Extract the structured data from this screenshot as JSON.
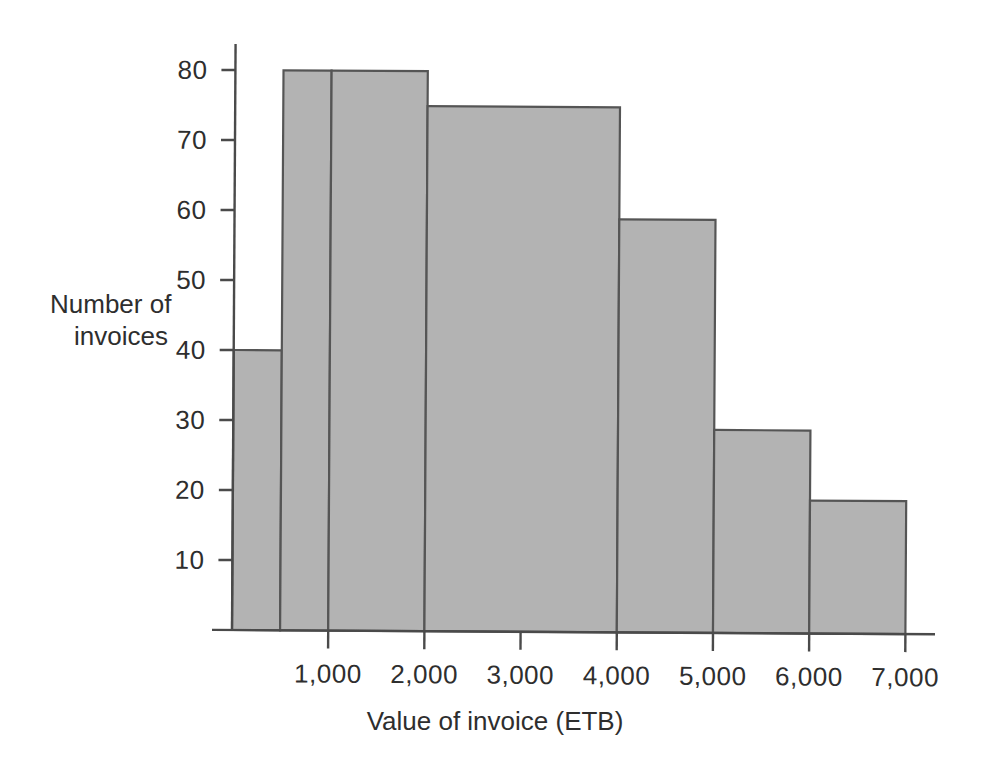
{
  "figure": {
    "background_color": "#ffffff",
    "bar_fill_color": "#b3b3b3",
    "bar_border_color": "#555555",
    "axis_color": "#4a4a4a",
    "text_color": "#2e2e2e"
  },
  "axes": {
    "y_title_line1": "Number of",
    "y_title_line2": "invoices",
    "x_title": "Value of invoice (ETB)",
    "y_ticks": [
      "10",
      "20",
      "30",
      "40",
      "50",
      "60",
      "70",
      "80"
    ],
    "x_ticks": [
      "1,000",
      "2,000",
      "3,000",
      "4,000",
      "5,000",
      "6,000",
      "7,000"
    ]
  },
  "chart_data": {
    "type": "bar",
    "title": "",
    "xlabel": "Value of invoice (ETB)",
    "ylabel": "Number of invoices",
    "xlim": [
      0,
      7000
    ],
    "ylim": [
      0,
      84
    ],
    "grid": false,
    "legend": null,
    "bin_edges": [
      0,
      500,
      1000,
      2000,
      3000,
      4000,
      5000,
      6000,
      7000
    ],
    "categories": [
      "0-500",
      "500-1,000",
      "1,000-2,000",
      "2,000-4,000",
      "4,000-5,000",
      "5,000-6,000",
      "6,000-7,000"
    ],
    "bars": [
      {
        "x_start": 0,
        "x_end": 500,
        "value": 40
      },
      {
        "x_start": 500,
        "x_end": 1000,
        "value": 80
      },
      {
        "x_start": 1000,
        "x_end": 2000,
        "value": 80
      },
      {
        "x_start": 2000,
        "x_end": 4000,
        "value": 75
      },
      {
        "x_start": 4000,
        "x_end": 5000,
        "value": 59
      },
      {
        "x_start": 5000,
        "x_end": 6000,
        "value": 29
      },
      {
        "x_start": 6000,
        "x_end": 7000,
        "value": 19
      }
    ],
    "values": [
      40,
      80,
      80,
      75,
      59,
      29,
      19
    ],
    "y_tick_values": [
      10,
      20,
      30,
      40,
      50,
      60,
      70,
      80
    ],
    "x_tick_values": [
      1000,
      2000,
      3000,
      4000,
      5000,
      6000,
      7000
    ]
  }
}
